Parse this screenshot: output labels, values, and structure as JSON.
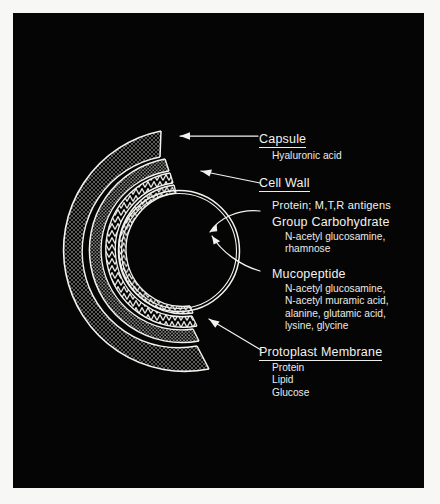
{
  "figure": {
    "background_color": "#050505",
    "ink_color": "#f2f2ee",
    "mount_color": "#f7f7f5",
    "layers": [
      {
        "name": "capsule",
        "texture": "stipple"
      },
      {
        "name": "cell-wall-outer",
        "texture": "stipple"
      },
      {
        "name": "group-carbohydrate",
        "texture": "chevron"
      },
      {
        "name": "mucopeptide",
        "texture": "chevron"
      },
      {
        "name": "protoplast-membrane",
        "texture": "double-line"
      }
    ]
  },
  "labels": [
    {
      "id": "capsule",
      "heading": "Capsule",
      "underlined": true,
      "items": [
        "Hyaluronic acid"
      ]
    },
    {
      "id": "cell-wall",
      "heading": "Cell Wall",
      "underlined": true,
      "items": []
    },
    {
      "id": "protein-antigens",
      "heading": "Protein; M,T,R antigens",
      "underlined": false,
      "items": []
    },
    {
      "id": "group-carbohydrate",
      "heading": "Group Carbohydrate",
      "underlined": false,
      "items": [
        "N-acetyl glucosamine,",
        "rhamnose"
      ]
    },
    {
      "id": "mucopeptide",
      "heading": "Mucopeptide",
      "underlined": false,
      "items": [
        "N-acetyl glucosamine,",
        "N-acetyl muramic acid,",
        "alanine, glutamic acid,",
        "lysine, glycine"
      ]
    },
    {
      "id": "protoplast-membrane",
      "heading": "Protoplast Membrane",
      "underlined": true,
      "items": [
        "Protein",
        "Lipid",
        "Glucose"
      ]
    }
  ]
}
